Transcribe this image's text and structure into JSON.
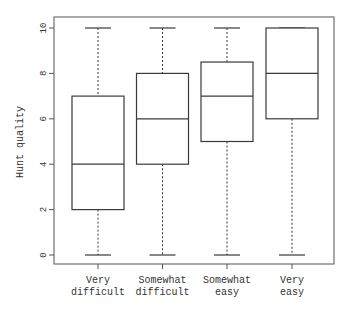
{
  "chart_data": {
    "type": "boxplot",
    "title": "",
    "xlabel": "",
    "ylabel": "Hunt quality",
    "ylim": [
      0,
      10
    ],
    "yticks": [
      0,
      2,
      4,
      6,
      8,
      10
    ],
    "grid": false,
    "legend": null,
    "categories": [
      {
        "line1": "Very",
        "line2": "difficult"
      },
      {
        "line1": "Somewhat",
        "line2": "difficult"
      },
      {
        "line1": "Somewhat",
        "line2": "easy"
      },
      {
        "line1": "Very",
        "line2": "easy"
      }
    ],
    "series": [
      {
        "name": "Very difficult",
        "min": 0,
        "q1": 2,
        "median": 4,
        "q3": 7,
        "max": 10
      },
      {
        "name": "Somewhat difficult",
        "min": 0,
        "q1": 4,
        "median": 6,
        "q3": 8,
        "max": 10
      },
      {
        "name": "Somewhat easy",
        "min": 0,
        "q1": 5,
        "median": 7,
        "q3": 8.5,
        "max": 10
      },
      {
        "name": "Very easy",
        "min": 0,
        "q1": 6,
        "median": 8,
        "q3": 10,
        "max": 10
      }
    ],
    "colors": {
      "stroke": "#3a3a3a",
      "frame": "#555555",
      "text": "#333333",
      "box_fill": "#ffffff"
    }
  }
}
